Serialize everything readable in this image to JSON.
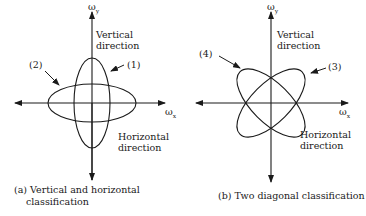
{
  "panel_a": {
    "axis_y_label": "ω",
    "axis_y_sub": "y",
    "axis_x_label": "ω",
    "axis_x_sub": "x",
    "vertical_direction_line1": "Vertical",
    "vertical_direction_line2": "direction",
    "horizontal_direction_line1": "Horizontal",
    "horizontal_direction_line2": "direction",
    "label_1": "(1)",
    "label_2": "(2)",
    "caption_line1": "(a) Vertical and horizontal",
    "caption_line2": "classification"
  },
  "panel_b": {
    "axis_y_label": "ω",
    "axis_y_sub": "y",
    "axis_x_label": "ω",
    "axis_x_sub": "x",
    "vertical_direction_line1": "Vertical",
    "vertical_direction_line2": "direction",
    "horizontal_direction_line1": "Horizontal",
    "horizontal_direction_line2": "direction",
    "label_3": "(3)",
    "label_4": "(4)",
    "caption": "(b) Two diagonal classification"
  },
  "colors": {
    "stroke": "#1a1a1a",
    "background": "#ffffff"
  }
}
